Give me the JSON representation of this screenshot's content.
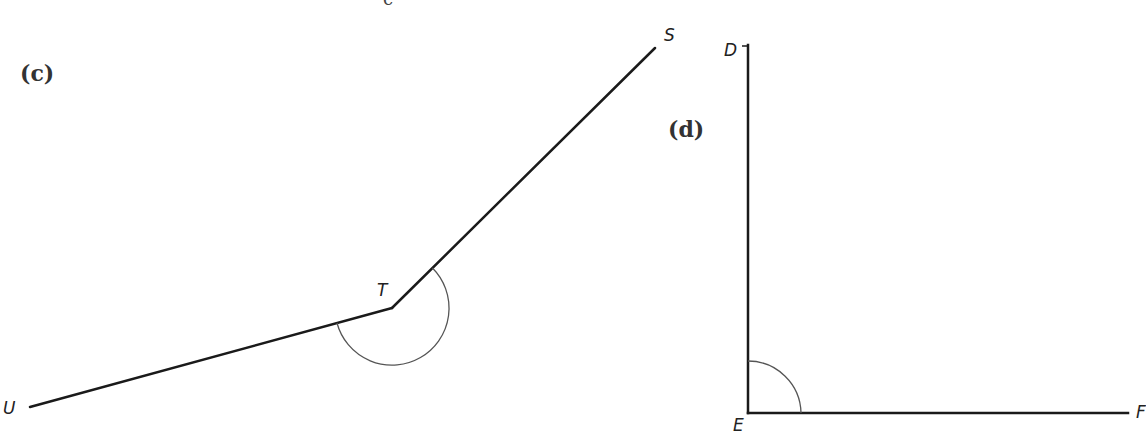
{
  "top_partial_label": "c",
  "figures": [
    {
      "part_label": "(c)",
      "angle_name": "STU",
      "angle_type": "reflex",
      "vertices": {
        "S": {
          "label": "S",
          "x": 655,
          "y": 48
        },
        "T": {
          "label": "T",
          "x": 392,
          "y": 308
        },
        "U": {
          "label": "U",
          "x": 30,
          "y": 407
        }
      },
      "arc_radius": 57
    },
    {
      "part_label": "(d)",
      "angle_name": "DEF",
      "angle_type": "right",
      "vertices": {
        "D": {
          "label": "D",
          "x": 748,
          "y": 45
        },
        "E": {
          "label": "E",
          "x": 748,
          "y": 413
        },
        "F": {
          "label": "F",
          "x": 1128,
          "y": 413
        }
      },
      "arc_radius": 53
    }
  ],
  "colors": {
    "line": "#1a1a1a",
    "arc": "#555555",
    "background": "#ffffff"
  }
}
